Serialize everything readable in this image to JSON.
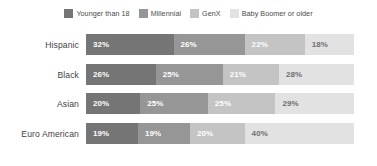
{
  "legend": {
    "items": [
      {
        "label": "Younger than 18",
        "color": "#757575",
        "swatch_name": "legend-swatch-younger-than-18"
      },
      {
        "label": "Millennial",
        "color": "#969696",
        "swatch_name": "legend-swatch-millennial"
      },
      {
        "label": "GenX",
        "color": "#c4c4c4",
        "swatch_name": "legend-swatch-genx"
      },
      {
        "label": "Baby Boomer or older",
        "color": "#e2e2e2",
        "swatch_name": "legend-swatch-baby-boomer-or-older"
      }
    ]
  },
  "chart_data": {
    "type": "bar",
    "orientation": "horizontal",
    "stacked": true,
    "normalized": true,
    "title": "",
    "subtitle": "",
    "xlabel": "",
    "ylabel": "",
    "xlim": [
      0,
      100
    ],
    "grid": false,
    "legend_position": "top-center",
    "value_suffix": "%",
    "categories": [
      "Hispanic",
      "Black",
      "Asian",
      "Euro American"
    ],
    "series": [
      {
        "name": "Younger than 18",
        "color": "#757575",
        "label_color": "#ffffff",
        "values": [
          32,
          26,
          20,
          19
        ]
      },
      {
        "name": "Millennial",
        "color": "#969696",
        "label_color": "#ffffff",
        "values": [
          26,
          25,
          25,
          19
        ]
      },
      {
        "name": "GenX",
        "color": "#c4c4c4",
        "label_color": "#ffffff",
        "values": [
          22,
          21,
          25,
          20
        ]
      },
      {
        "name": "Baby Boomer or older",
        "color": "#e2e2e2",
        "label_color": "#6e6e6e",
        "values": [
          18,
          28,
          29,
          40
        ]
      }
    ],
    "rows": [
      {
        "category": "Hispanic",
        "segments": [
          {
            "series": "Younger than 18",
            "value": 32,
            "label": "32%",
            "color": "#757575",
            "label_color": "#ffffff"
          },
          {
            "series": "Millennial",
            "value": 26,
            "label": "26%",
            "color": "#969696",
            "label_color": "#ffffff"
          },
          {
            "series": "GenX",
            "value": 22,
            "label": "22%",
            "color": "#c4c4c4",
            "label_color": "#ffffff"
          },
          {
            "series": "Baby Boomer or older",
            "value": 18,
            "label": "18%",
            "color": "#e2e2e2",
            "label_color": "#6e6e6e"
          }
        ]
      },
      {
        "category": "Black",
        "segments": [
          {
            "series": "Younger than 18",
            "value": 26,
            "label": "26%",
            "color": "#757575",
            "label_color": "#ffffff"
          },
          {
            "series": "Millennial",
            "value": 25,
            "label": "25%",
            "color": "#969696",
            "label_color": "#ffffff"
          },
          {
            "series": "GenX",
            "value": 21,
            "label": "21%",
            "color": "#c4c4c4",
            "label_color": "#ffffff"
          },
          {
            "series": "Baby Boomer or older",
            "value": 28,
            "label": "28%",
            "color": "#e2e2e2",
            "label_color": "#6e6e6e"
          }
        ]
      },
      {
        "category": "Asian",
        "segments": [
          {
            "series": "Younger than 18",
            "value": 20,
            "label": "20%",
            "color": "#757575",
            "label_color": "#ffffff"
          },
          {
            "series": "Millennial",
            "value": 25,
            "label": "25%",
            "color": "#969696",
            "label_color": "#ffffff"
          },
          {
            "series": "GenX",
            "value": 25,
            "label": "25%",
            "color": "#c4c4c4",
            "label_color": "#ffffff"
          },
          {
            "series": "Baby Boomer or older",
            "value": 29,
            "label": "29%",
            "color": "#e2e2e2",
            "label_color": "#6e6e6e"
          }
        ]
      },
      {
        "category": "Euro American",
        "segments": [
          {
            "series": "Younger than 18",
            "value": 19,
            "label": "19%",
            "color": "#757575",
            "label_color": "#ffffff"
          },
          {
            "series": "Millennial",
            "value": 19,
            "label": "19%",
            "color": "#969696",
            "label_color": "#ffffff"
          },
          {
            "series": "GenX",
            "value": 20,
            "label": "20%",
            "color": "#c4c4c4",
            "label_color": "#ffffff"
          },
          {
            "series": "Baby Boomer or older",
            "value": 40,
            "label": "40%",
            "color": "#e2e2e2",
            "label_color": "#6e6e6e"
          }
        ]
      }
    ]
  },
  "layout": {
    "row_tops": [
      4,
      34,
      63,
      93
    ],
    "background": "#ffffff"
  }
}
